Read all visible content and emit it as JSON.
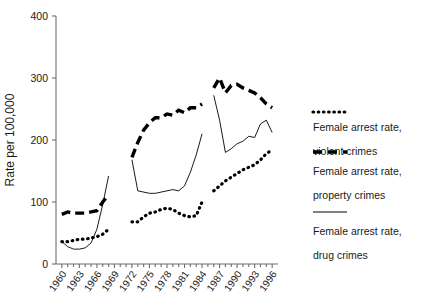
{
  "chart_data": {
    "type": "line",
    "title": "",
    "xlabel": "",
    "ylabel": "Rate per 100,000",
    "ylim": [
      0,
      400
    ],
    "yticks": [
      0,
      100,
      200,
      300,
      400
    ],
    "xlim": [
      1959,
      1997
    ],
    "xticks": [
      1960,
      1963,
      1966,
      1969,
      1972,
      1975,
      1978,
      1981,
      1984,
      1987,
      1990,
      1993,
      1996
    ],
    "grid": false,
    "legend_position": "right",
    "series": [
      {
        "name": "Female arrest rate, violent crimes",
        "key": "violent",
        "style": "dashed",
        "segments": [
          {
            "x": [
              1960,
              1961,
              1962,
              1963,
              1964,
              1965,
              1966,
              1967,
              1968
            ],
            "y": [
              80,
              84,
              82,
              82,
              82,
              84,
              86,
              100,
              112
            ]
          },
          {
            "x": [
              1972,
              1973,
              1974,
              1975,
              1976,
              1977,
              1978,
              1979,
              1980,
              1981,
              1982,
              1983,
              1984
            ],
            "y": [
              172,
              196,
              216,
              228,
              236,
              236,
              242,
              240,
              248,
              244,
              252,
              252,
              258
            ]
          },
          {
            "x": [
              1986,
              1987,
              1988,
              1989,
              1990,
              1991,
              1992,
              1993,
              1994,
              1995,
              1996
            ],
            "y": [
              284,
              300,
              276,
              288,
              290,
              284,
              280,
              276,
              268,
              258,
              252
            ]
          }
        ]
      },
      {
        "name": "Female arrest rate, property crimes",
        "key": "property",
        "style": "solid",
        "segments": [
          {
            "x": [
              1960,
              1961,
              1962,
              1963,
              1964,
              1965,
              1966,
              1967,
              1968
            ],
            "y": [
              36,
              28,
              24,
              24,
              26,
              34,
              56,
              96,
              142
            ]
          },
          {
            "x": [
              1972,
              1973,
              1974,
              1975,
              1976,
              1977,
              1978,
              1979,
              1980,
              1981,
              1982,
              1983,
              1984
            ],
            "y": [
              168,
              118,
              116,
              114,
              114,
              116,
              118,
              120,
              118,
              126,
              148,
              176,
              210
            ]
          },
          {
            "x": [
              1986,
              1987,
              1988,
              1989,
              1990,
              1991,
              1992,
              1993,
              1994,
              1995,
              1996
            ],
            "y": [
              272,
              232,
              180,
              186,
              194,
              198,
              206,
              204,
              226,
              232,
              212
            ]
          }
        ]
      },
      {
        "name": "Female arrest rate, drug crimes",
        "key": "drug",
        "style": "dotted",
        "segments": [
          {
            "x": [
              1960,
              1961,
              1962,
              1963,
              1964,
              1965,
              1966,
              1967,
              1968
            ],
            "y": [
              36,
              36,
              38,
              40,
              40,
              42,
              44,
              48,
              56
            ]
          },
          {
            "x": [
              1972,
              1973,
              1974,
              1975,
              1976,
              1977,
              1978,
              1979,
              1980,
              1981,
              1982,
              1983,
              1984
            ],
            "y": [
              68,
              68,
              76,
              82,
              84,
              88,
              90,
              88,
              82,
              78,
              76,
              78,
              100
            ]
          },
          {
            "x": [
              1986,
              1987,
              1988,
              1989,
              1990,
              1991,
              1992,
              1993,
              1994,
              1995,
              1996
            ],
            "y": [
              118,
              126,
              134,
              140,
              146,
              152,
              156,
              160,
              168,
              178,
              184
            ]
          }
        ]
      }
    ]
  },
  "axes": {
    "y_label": "Rate per 100,000",
    "y_tick_labels": [
      "400",
      "300",
      "200",
      "100",
      "0"
    ],
    "x_tick_labels": [
      "1960",
      "1963",
      "1966",
      "1969",
      "1972",
      "1975",
      "1978",
      "1981",
      "1984",
      "1987",
      "1990",
      "1993",
      "1996"
    ]
  },
  "legend": {
    "entries": [
      {
        "marker": "dotted-line-marker",
        "line1": "Female arrest rate,",
        "line2": "violent crimes"
      },
      {
        "marker": "dashed-line-marker",
        "line1": "Female arrest rate,",
        "line2": "property crimes"
      },
      {
        "marker": "solid-line-marker",
        "line1": "Female arrest rate,",
        "line2": "drug crimes"
      }
    ]
  },
  "colors": {
    "ink": "#000000",
    "axis": "#6d6d6d",
    "background": "#ffffff"
  }
}
